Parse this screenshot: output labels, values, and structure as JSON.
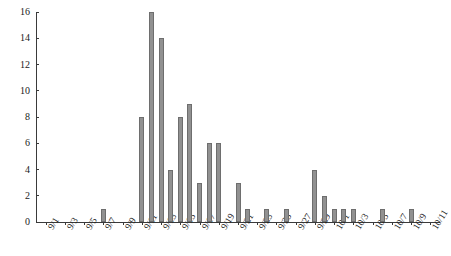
{
  "chart_data": {
    "type": "bar",
    "title": "",
    "subtitle": "",
    "xlabel": "",
    "ylabel": "",
    "ylim": [
      0,
      16
    ],
    "ytick_values": [
      0,
      2,
      4,
      6,
      8,
      10,
      12,
      14,
      16
    ],
    "ytick_labels": [
      "0",
      "2",
      "4",
      "6",
      "8",
      "10",
      "12",
      "14",
      "16"
    ],
    "xtick_labels": [
      "9/1",
      "9/3",
      "9/5",
      "9/7",
      "9/9",
      "9/11",
      "9/13",
      "9/15",
      "9/17",
      "9/19",
      "9/21",
      "9/23",
      "9/25",
      "9/27",
      "9/29",
      "10/1",
      "10/3",
      "10/5",
      "10/7",
      "10/9",
      "10/11"
    ],
    "grid": false,
    "legend": null,
    "bar_color": "#919191",
    "bar_edge_color": "#6e6e6e",
    "axis_color": "#3a3a3a",
    "categories": [
      "9/1",
      "9/2",
      "9/3",
      "9/4",
      "9/5",
      "9/6",
      "9/7",
      "9/8",
      "9/9",
      "9/10",
      "9/11",
      "9/12",
      "9/13",
      "9/14",
      "9/15",
      "9/16",
      "9/17",
      "9/18",
      "9/19",
      "9/20",
      "9/21",
      "9/22",
      "9/23",
      "9/24",
      "9/25",
      "9/26",
      "9/27",
      "9/28",
      "9/29",
      "9/30",
      "10/1",
      "10/2",
      "10/3",
      "10/4",
      "10/5",
      "10/6",
      "10/7",
      "10/8",
      "10/9",
      "10/10",
      "10/11"
    ],
    "values": [
      0,
      0,
      0,
      0,
      0,
      0,
      1,
      0,
      0,
      0,
      8,
      16,
      14,
      4,
      8,
      9,
      3,
      6,
      6,
      0,
      3,
      1,
      0,
      1,
      0,
      1,
      0,
      0,
      4,
      2,
      1,
      1,
      1,
      0,
      0,
      1,
      0,
      0,
      1,
      0,
      0
    ]
  }
}
